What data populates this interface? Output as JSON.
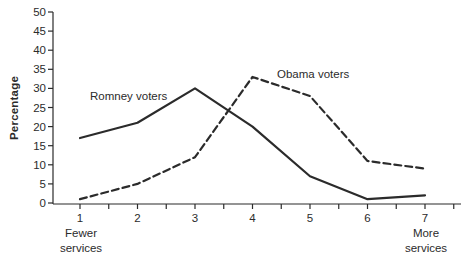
{
  "chart_data": {
    "type": "line",
    "title": "",
    "ylabel": "Percentage",
    "xlabel": "",
    "x": [
      1,
      2,
      3,
      4,
      5,
      6,
      7
    ],
    "ylim": [
      0,
      50
    ],
    "ytick_step": 5,
    "grid": false,
    "legend": "inline-labels",
    "ink_color": "#2b2b2b",
    "series": [
      {
        "name": "Romney voters",
        "style": "solid",
        "values": [
          17,
          21,
          30,
          20,
          7,
          1,
          2
        ]
      },
      {
        "name": "Obama voters",
        "style": "dashed",
        "values": [
          1,
          5,
          12,
          33,
          28,
          11,
          9
        ]
      }
    ],
    "x_end_notes": {
      "left": [
        "Fewer",
        "services"
      ],
      "right": [
        "More",
        "services"
      ]
    }
  }
}
